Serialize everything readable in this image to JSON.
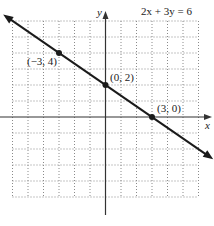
{
  "chart_data": {
    "type": "line",
    "title": "2x + 3y = 6",
    "xlabel": "x",
    "ylabel": "y",
    "xlim": [
      -6,
      6
    ],
    "ylim": [
      -5,
      6
    ],
    "grid": true,
    "grid_style": "dotted",
    "series": [
      {
        "name": "2x + 3y = 6",
        "equation": "2x + 3y = 6",
        "slope": -0.6667,
        "intercept": 2,
        "x": [
          -3,
          0,
          3
        ],
        "y": [
          4,
          2,
          0
        ]
      }
    ],
    "points": [
      {
        "x": -3,
        "y": 4,
        "label": "(−3, 4)"
      },
      {
        "x": 0,
        "y": 2,
        "label": "(0, 2)"
      },
      {
        "x": 3,
        "y": 0,
        "label": "(3, 0)"
      }
    ],
    "annotations": [
      "(−3, 4)",
      "(0, 2)",
      "(3, 0)",
      "2x + 3y = 6"
    ]
  },
  "colors": {
    "line": "#1a1a1a",
    "axis": "#333333",
    "grid": "#8a8a8a",
    "text": "#222222"
  }
}
